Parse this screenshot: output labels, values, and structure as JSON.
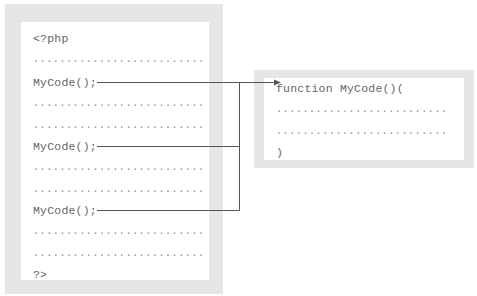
{
  "caller_file": {
    "lines": [
      "<?php",
      "..........................",
      "MyCode();",
      "..........................",
      "..........................",
      "MyCode();",
      "..........................",
      "..........................",
      "MyCode();",
      "..........................",
      "..........................",
      "?>"
    ]
  },
  "function_file": {
    "lines": [
      "function MyCode()(",
      "..........................",
      "..........................",
      ")"
    ]
  },
  "connector_color": "#555555"
}
